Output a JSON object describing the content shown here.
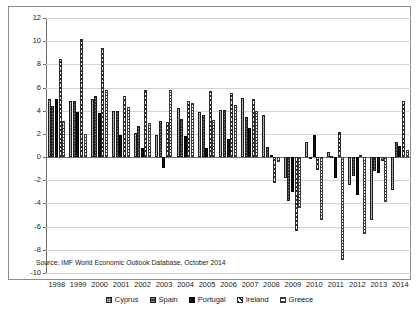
{
  "figure": {
    "ylabel": "Percent",
    "source_note": "Source: IMF World Economic Outlook Database, October 2014"
  },
  "legend": {
    "position": "bottom",
    "items": [
      {
        "label": "Cyprus",
        "swatch": "legend-swatch-cyprus"
      },
      {
        "label": "Spain",
        "swatch": "legend-swatch-spain"
      },
      {
        "label": "Portugal",
        "swatch": "legend-swatch-portugal"
      },
      {
        "label": "Ireland",
        "swatch": "legend-swatch-ireland"
      },
      {
        "label": "Greece",
        "swatch": "legend-swatch-greece"
      }
    ]
  },
  "chart_data": {
    "type": "bar",
    "title": "",
    "xlabel": "",
    "ylabel": "Percent",
    "ylim": [
      -10,
      12
    ],
    "yticks": [
      12,
      10,
      8,
      6,
      4,
      2,
      0,
      -2,
      -4,
      -6,
      -8,
      -10
    ],
    "ytick_labels": [
      "12",
      "10",
      "8",
      "6",
      "4",
      "2",
      "0",
      "-2",
      "-4",
      "-6",
      "-8",
      "-10"
    ],
    "grid": true,
    "legend_position": "bottom",
    "categories": [
      "1998",
      "1999",
      "2000",
      "2001",
      "2002",
      "2003",
      "2004",
      "2005",
      "2006",
      "2007",
      "2008",
      "2009",
      "2010",
      "2011",
      "2012",
      "2013",
      "2014"
    ],
    "series": [
      {
        "name": "Cyprus",
        "values": [
          5.0,
          4.8,
          5.0,
          4.0,
          2.1,
          1.9,
          4.2,
          3.9,
          4.1,
          5.1,
          3.6,
          -1.8,
          1.3,
          0.4,
          -2.4,
          -5.4,
          -2.8
        ]
      },
      {
        "name": "Spain",
        "values": [
          4.4,
          4.8,
          5.3,
          4.0,
          2.7,
          3.1,
          3.3,
          3.6,
          4.1,
          3.5,
          0.9,
          -3.8,
          -0.2,
          0.1,
          -1.6,
          -1.2,
          1.3
        ]
      },
      {
        "name": "Portugal",
        "values": [
          5.0,
          3.9,
          3.8,
          1.9,
          0.8,
          -0.9,
          1.8,
          0.8,
          1.6,
          2.5,
          0.2,
          -3.0,
          1.9,
          -1.8,
          -3.3,
          -1.4,
          1.0
        ]
      },
      {
        "name": "Ireland",
        "values": [
          8.5,
          10.2,
          9.4,
          5.3,
          5.8,
          3.0,
          4.8,
          5.7,
          5.5,
          5.0,
          -2.2,
          -6.4,
          -1.1,
          2.2,
          0.2,
          -0.3,
          4.8
        ]
      },
      {
        "name": "Greece",
        "values": [
          3.1,
          2.0,
          5.8,
          4.3,
          2.9,
          5.8,
          4.7,
          3.2,
          4.5,
          4.0,
          -0.4,
          -4.4,
          -5.4,
          -8.9,
          -6.6,
          -3.9,
          0.6
        ]
      }
    ]
  }
}
